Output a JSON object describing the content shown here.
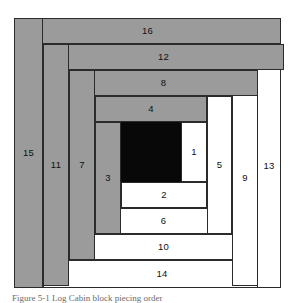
{
  "figure": {
    "kind": "log-cabin-quilt-block-diagram",
    "caption": "Figure 5-1  Log Cabin block piecing order",
    "colors": {
      "dark_fabric": "#9b9b9b",
      "light_fabric": "#ffffff",
      "center_square": "#080808",
      "seam_line": "#2b2b2b"
    }
  },
  "pieces": [
    {
      "n": "1",
      "shade": "light",
      "x": 167,
      "y": 111,
      "w": 26,
      "h": 60,
      "orient": "vertical"
    },
    {
      "n": "2",
      "shade": "light",
      "x": 107,
      "y": 171,
      "w": 86,
      "h": 26,
      "orient": "horizontal"
    },
    {
      "n": "3",
      "shade": "dark",
      "x": 81,
      "y": 111,
      "w": 26,
      "h": 112,
      "orient": "vertical"
    },
    {
      "n": "4",
      "shade": "dark",
      "x": 81,
      "y": 85,
      "w": 112,
      "h": 26,
      "orient": "horizontal"
    },
    {
      "n": "5",
      "shade": "light",
      "x": 193,
      "y": 85,
      "w": 25,
      "h": 138,
      "orient": "vertical"
    },
    {
      "n": "6",
      "shade": "light",
      "x": 81,
      "y": 197,
      "w": 137,
      "h": 26,
      "orient": "horizontal"
    },
    {
      "n": "7",
      "shade": "dark",
      "x": 55,
      "y": 59,
      "w": 26,
      "h": 190,
      "orient": "vertical"
    },
    {
      "n": "8",
      "shade": "dark",
      "x": 55,
      "y": 59,
      "w": 189,
      "h": 26,
      "orient": "horizontal"
    },
    {
      "n": "9",
      "shade": "light",
      "x": 218,
      "y": 59,
      "w": 26,
      "h": 216,
      "orient": "vertical"
    },
    {
      "n": "10",
      "shade": "light",
      "x": 55,
      "y": 223,
      "w": 189,
      "h": 26,
      "orient": "horizontal"
    },
    {
      "n": "11",
      "shade": "dark",
      "x": 29,
      "y": 33,
      "w": 26,
      "h": 242,
      "orient": "vertical"
    },
    {
      "n": "12",
      "shade": "dark",
      "x": 29,
      "y": 33,
      "w": 241,
      "h": 26,
      "orient": "horizontal"
    },
    {
      "n": "13",
      "shade": "light",
      "x": 243,
      "y": 33,
      "w": 24,
      "h": 244,
      "orient": "vertical"
    },
    {
      "n": "14",
      "shade": "light",
      "x": 29,
      "y": 249,
      "w": 238,
      "h": 28,
      "orient": "horizontal"
    },
    {
      "n": "15",
      "shade": "dark",
      "x": 0,
      "y": 7,
      "w": 29,
      "h": 270,
      "orient": "vertical"
    },
    {
      "n": "16",
      "shade": "dark",
      "x": 0,
      "y": 7,
      "w": 267,
      "h": 26,
      "orient": "horizontal"
    }
  ],
  "center": {
    "label": "",
    "x": 107,
    "y": 111,
    "w": 60,
    "h": 60,
    "shade": "center"
  }
}
